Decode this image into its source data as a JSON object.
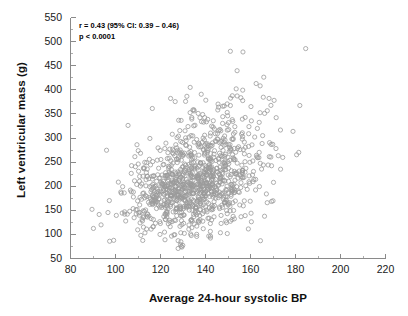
{
  "chart_data": {
    "type": "scatter",
    "title": "",
    "xlabel": "Average 24-hour systolic BP",
    "ylabel": "Left ventricular mass (g)",
    "xlim": [
      80,
      220
    ],
    "ylim": [
      50,
      550
    ],
    "xticks": [
      80,
      100,
      120,
      140,
      160,
      180,
      200,
      220
    ],
    "yticks": [
      50,
      100,
      150,
      200,
      250,
      300,
      350,
      400,
      450,
      500,
      550
    ],
    "xminor_step": 10,
    "yminor_step": 25,
    "grid": false,
    "legend": null,
    "marker": {
      "shape": "open-circle",
      "color": "#9a9a9a",
      "size_px": 4.2,
      "stroke_px": 0.8,
      "fill": "none"
    },
    "n_points": 1100,
    "distribution": {
      "x_mean": 136,
      "x_sd": 15.5,
      "y_mean": 208,
      "y_sd": 57,
      "correlation": 0.43,
      "x_min": 88,
      "x_max": 212,
      "y_min": 70,
      "y_max": 525
    },
    "annotations": [
      {
        "name": "correlation",
        "text": "r = 0.43 (95% CI: 0.39 – 0.46)"
      },
      {
        "name": "p-value",
        "text": "p < 0.0001"
      }
    ],
    "stats": {
      "r": 0.43,
      "ci_low": 0.39,
      "ci_high": 0.46,
      "ci_level": "95%",
      "p_text": "p < 0.0001"
    },
    "axis_color": "#8a8a8a",
    "text_color": "#111111"
  }
}
